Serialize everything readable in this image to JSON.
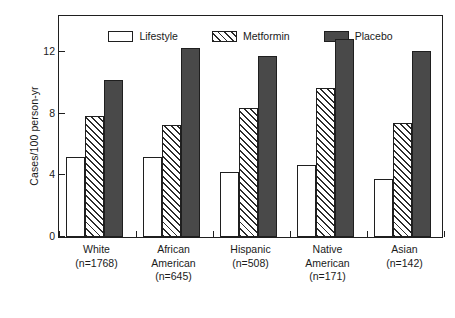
{
  "chart_data": {
    "type": "bar",
    "title": "",
    "subtitle": "",
    "xlabel": "",
    "ylabel": "Cases/100 person-yr",
    "ylim": [
      0,
      14.5
    ],
    "yticks": [
      0,
      4,
      8,
      12
    ],
    "ytick_labels": [
      "0",
      "4",
      "8",
      "12"
    ],
    "grid": false,
    "legend_position": "top-center-inside",
    "categories": [
      "White\n(n=1768)",
      "African\nAmerican\n(n=645)",
      "Hispanic\n(n=508)",
      "Native\nAmerican\n(n=171)",
      "Asian\n(n=142)"
    ],
    "category_lines": [
      [
        "White",
        "(n=1768)"
      ],
      [
        "African",
        "American",
        "(n=645)"
      ],
      [
        "Hispanic",
        "(n=508)"
      ],
      [
        "Native",
        "American",
        "(n=171)"
      ],
      [
        "Asian",
        "(n=142)"
      ]
    ],
    "series": [
      {
        "name": "Lifestyle",
        "fill": "open",
        "color": "#ffffff",
        "values": [
          5.2,
          5.2,
          4.2,
          4.7,
          3.8
        ]
      },
      {
        "name": "Metformin",
        "fill": "hatch",
        "color": "#ffffff",
        "values": [
          7.9,
          7.3,
          8.4,
          9.7,
          7.4
        ]
      },
      {
        "name": "Placebo",
        "fill": "solid",
        "color": "#494949",
        "values": [
          10.2,
          12.3,
          11.8,
          12.9,
          12.1
        ]
      }
    ]
  },
  "axis": {
    "y_title": "Cases/100 person-yr",
    "tick_0": "0",
    "tick_4": "4",
    "tick_8": "8",
    "tick_12": "12"
  },
  "legend": {
    "items": [
      {
        "label": "Lifestyle",
        "swatch": "open-box-swatch"
      },
      {
        "label": "Metformin",
        "swatch": "hatched-box-swatch"
      },
      {
        "label": "Placebo",
        "swatch": "solid-box-swatch"
      }
    ]
  },
  "colors": {
    "axis": "#1f1f1f",
    "placebo": "#494949",
    "hatch": "#2b2b2b",
    "background": "#ffffff"
  }
}
